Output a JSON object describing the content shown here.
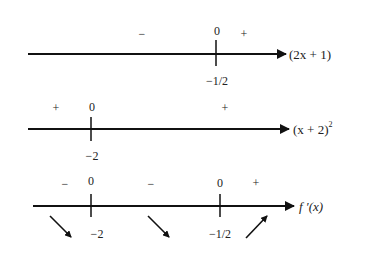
{
  "diagram": {
    "type": "sign-chart",
    "rows": [
      {
        "label": "(2x + 1)",
        "critical_points": [
          {
            "x": "−1/2",
            "value": "0"
          }
        ],
        "signs": [
          "−",
          "+"
        ]
      },
      {
        "label": "(x + 2)",
        "label_superscript": "2",
        "critical_points": [
          {
            "x": "−2",
            "value": "0"
          }
        ],
        "signs": [
          "+",
          "+"
        ]
      },
      {
        "label": "f ′(x)",
        "critical_points": [
          {
            "x": "−2",
            "value": "0"
          },
          {
            "x": "−1/2",
            "value": "0"
          }
        ],
        "signs": [
          "−",
          "−",
          "+"
        ],
        "behavior": [
          "decreasing",
          "decreasing",
          "increasing"
        ]
      }
    ]
  }
}
